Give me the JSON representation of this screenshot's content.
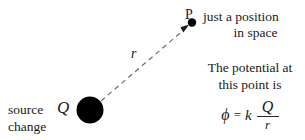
{
  "figure": {
    "background_color": "#ffffff",
    "ink_color": "#1a1a1a",
    "dash_color": "#6b6b6b"
  },
  "source": {
    "symbol": "Q",
    "caption_line1": "source",
    "caption_line2": "change",
    "marker": "filled-circle",
    "center_x": 90,
    "center_y": 110,
    "radius": 13,
    "color": "#000000"
  },
  "field_point": {
    "label": "P",
    "marker": "filled-dot",
    "center_x": 192,
    "center_y": 22,
    "radius": 4,
    "color": "#000000"
  },
  "distance_vector": {
    "label": "r",
    "style": "dashed-arrow",
    "from_x": 101,
    "from_y": 101,
    "to_x": 189,
    "to_y": 26,
    "dash_pattern": "5,4",
    "color": "#6b6b6b"
  },
  "annotations": {
    "position_note": {
      "line1": "just a position",
      "line2": "in space"
    },
    "potential_note": {
      "line1": "The potential at",
      "line2": "this point is"
    }
  },
  "formula": {
    "lhs": "ϕ",
    "equals": "=",
    "coefficient": "k",
    "numerator": "Q",
    "denominator": "r",
    "plain": "ϕ = k Q/r"
  }
}
